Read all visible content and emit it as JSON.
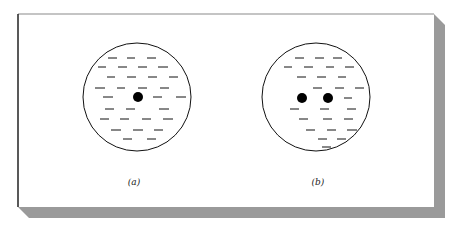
{
  "figure": {
    "panels": [
      {
        "id": "a",
        "label": "(a)",
        "circle": {
          "cx": 137,
          "cy": 97,
          "r": 54
        },
        "particles": [
          {
            "x": 138,
            "y": 97
          }
        ],
        "dashes": [
          [
            108,
            58,
            117
          ],
          [
            127,
            58,
            135
          ],
          [
            147,
            58,
            156
          ],
          [
            98,
            67,
            106
          ],
          [
            118,
            67,
            127
          ],
          [
            138,
            67,
            147
          ],
          [
            158,
            67,
            168
          ],
          [
            107,
            77,
            115
          ],
          [
            127,
            77,
            136
          ],
          [
            148,
            77,
            157
          ],
          [
            169,
            77,
            178
          ],
          [
            95,
            88,
            105
          ],
          [
            117,
            88,
            125
          ],
          [
            138,
            88,
            147
          ],
          [
            160,
            88,
            169
          ],
          [
            103,
            97,
            113
          ],
          [
            153,
            97,
            162
          ],
          [
            176,
            97,
            186
          ],
          [
            105,
            109,
            114
          ],
          [
            126,
            109,
            135
          ],
          [
            159,
            109,
            169
          ],
          [
            100,
            119,
            109
          ],
          [
            120,
            119,
            129
          ],
          [
            142,
            119,
            151
          ],
          [
            163,
            119,
            173
          ],
          [
            111,
            130,
            121
          ],
          [
            133,
            130,
            143
          ],
          [
            154,
            130,
            163
          ],
          [
            123,
            139,
            132
          ],
          [
            147,
            139,
            156
          ]
        ]
      },
      {
        "id": "b",
        "label": "(b)",
        "circle": {
          "cx": 316,
          "cy": 97,
          "r": 54
        },
        "particles": [
          {
            "x": 302,
            "y": 98
          },
          {
            "x": 328,
            "y": 98
          }
        ],
        "dashes": [
          [
            295,
            58,
            304
          ],
          [
            315,
            58,
            324
          ],
          [
            333,
            58,
            342
          ],
          [
            284,
            67,
            292
          ],
          [
            304,
            67,
            313
          ],
          [
            326,
            67,
            334
          ],
          [
            345,
            67,
            354
          ],
          [
            297,
            77,
            306
          ],
          [
            317,
            77,
            326
          ],
          [
            338,
            77,
            346
          ],
          [
            313,
            88,
            322
          ],
          [
            335,
            88,
            344
          ],
          [
            355,
            88,
            364
          ],
          [
            344,
            98,
            352
          ],
          [
            290,
            109,
            299
          ],
          [
            320,
            109,
            329
          ],
          [
            347,
            109,
            356
          ],
          [
            299,
            119,
            308
          ],
          [
            323,
            119,
            332
          ],
          [
            344,
            119,
            353
          ],
          [
            306,
            130,
            315
          ],
          [
            327,
            130,
            336
          ],
          [
            347,
            130,
            357
          ],
          [
            318,
            139,
            327
          ],
          [
            337,
            139,
            346
          ],
          [
            322,
            147,
            331
          ]
        ]
      }
    ]
  },
  "frame": {
    "box": {
      "x": 18,
      "y": 14,
      "w": 416,
      "h": 193
    },
    "shadow_offset": 11,
    "shadow_color": "#9a9a9a",
    "border_color": "#222222"
  }
}
